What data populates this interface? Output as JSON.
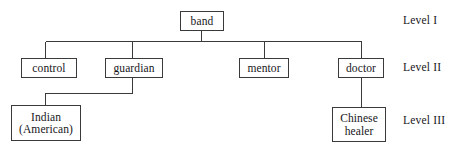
{
  "diagram": {
    "type": "hierarchy-tree",
    "orientation": "top-down",
    "background_color": "#ffffff",
    "line_color": "#3a3a3a",
    "text_color": "#17161a",
    "nodes": [
      {
        "id": "band",
        "label": "band",
        "level": "Level I",
        "x": 180,
        "y": 11,
        "w": 44,
        "h": 20,
        "font_size": 11.5
      },
      {
        "id": "control",
        "label": "control",
        "level": "Level II",
        "x": 21,
        "y": 58,
        "w": 56,
        "h": 20,
        "font_size": 11.5
      },
      {
        "id": "guardian",
        "label": "guardian",
        "level": "Level II",
        "x": 105,
        "y": 58,
        "w": 58,
        "h": 20,
        "font_size": 11.5
      },
      {
        "id": "mentor",
        "label": "mentor",
        "level": "Level II",
        "x": 239,
        "y": 58,
        "w": 50,
        "h": 20,
        "font_size": 11.5
      },
      {
        "id": "doctor",
        "label": "doctor",
        "level": "Level II",
        "x": 338,
        "y": 58,
        "w": 46,
        "h": 20,
        "font_size": 11.5
      },
      {
        "id": "indian-american",
        "label": "Indian\n(American)",
        "level": "Level III",
        "x": 11,
        "y": 105,
        "w": 70,
        "h": 36,
        "font_size": 11.5
      },
      {
        "id": "chinese-healer",
        "label": "Chinese\nhealer",
        "level": "Level III",
        "x": 332,
        "y": 107,
        "w": 54,
        "h": 35,
        "font_size": 11.5
      }
    ],
    "edges": [
      {
        "from": "band",
        "to": "control"
      },
      {
        "from": "band",
        "to": "guardian"
      },
      {
        "from": "band",
        "to": "mentor"
      },
      {
        "from": "band",
        "to": "doctor"
      },
      {
        "from": "guardian",
        "to": "indian-american"
      },
      {
        "from": "doctor",
        "to": "chinese-healer"
      }
    ],
    "level_labels": [
      {
        "id": "level-1",
        "text": "Level I",
        "x": 403,
        "y": 14,
        "font_size": 11.5
      },
      {
        "id": "level-2",
        "text": "Level II",
        "x": 403,
        "y": 61,
        "font_size": 11.5
      },
      {
        "id": "level-3",
        "text": "Level III",
        "x": 403,
        "y": 114,
        "font_size": 11.5
      }
    ]
  }
}
